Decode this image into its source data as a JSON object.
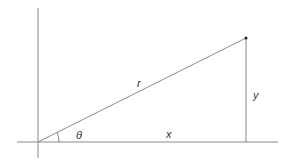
{
  "diagram": {
    "type": "polar-coordinates-right-triangle",
    "colors": {
      "line": "#8a8a8a",
      "point": "#222222",
      "text": "#333333",
      "background": "#ffffff"
    },
    "axes": {
      "vertical": {
        "x": 38,
        "y1": 8,
        "y2": 158
      },
      "horizontal": {
        "y": 142,
        "x1": 17,
        "x2": 278
      }
    },
    "origin": {
      "x": 38,
      "y": 142
    },
    "point": {
      "x": 246,
      "y": 38
    },
    "labels": {
      "hypotenuse": "r",
      "opposite": "y",
      "adjacent": "x",
      "angle": "θ"
    }
  }
}
